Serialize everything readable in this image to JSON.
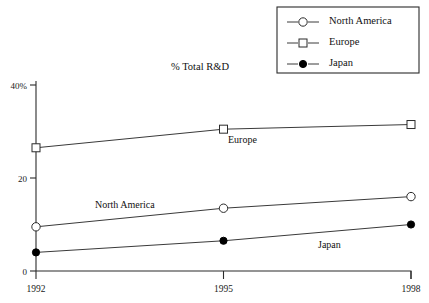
{
  "chart_data": {
    "type": "line",
    "title": "% Total R&D",
    "xlabel": "",
    "ylabel": "",
    "categories": [
      "1992",
      "1995",
      "1998"
    ],
    "x": [
      1992,
      1995,
      1998
    ],
    "ylim": [
      0,
      40
    ],
    "y_ticks": [
      "0",
      "20",
      "40%"
    ],
    "y_tick_values": [
      0,
      20,
      40
    ],
    "grid": false,
    "legend_position": "top-right",
    "series": [
      {
        "name": "North America",
        "marker": "open-circle",
        "values": [
          9.5,
          13.5,
          16
        ]
      },
      {
        "name": "Europe",
        "marker": "open-square",
        "values": [
          26.5,
          30.5,
          31.5
        ]
      },
      {
        "name": "Japan",
        "marker": "filled-circle",
        "values": [
          4,
          6.5,
          10
        ]
      }
    ],
    "annotations": [
      {
        "text": "Europe",
        "series": "Europe"
      },
      {
        "text": "North America",
        "series": "North America"
      },
      {
        "text": "Japan",
        "series": "Japan"
      }
    ],
    "colors": {
      "line": "#3a3a3a",
      "axis": "#2b2b2b",
      "marker_fill_open": "#ffffff",
      "marker_fill_solid": "#000000",
      "background": "#ffffff"
    }
  },
  "legend": {
    "items": [
      {
        "label": "North America",
        "marker": "open-circle"
      },
      {
        "label": "Europe",
        "marker": "open-square"
      },
      {
        "label": "Japan",
        "marker": "filled-circle"
      }
    ]
  }
}
